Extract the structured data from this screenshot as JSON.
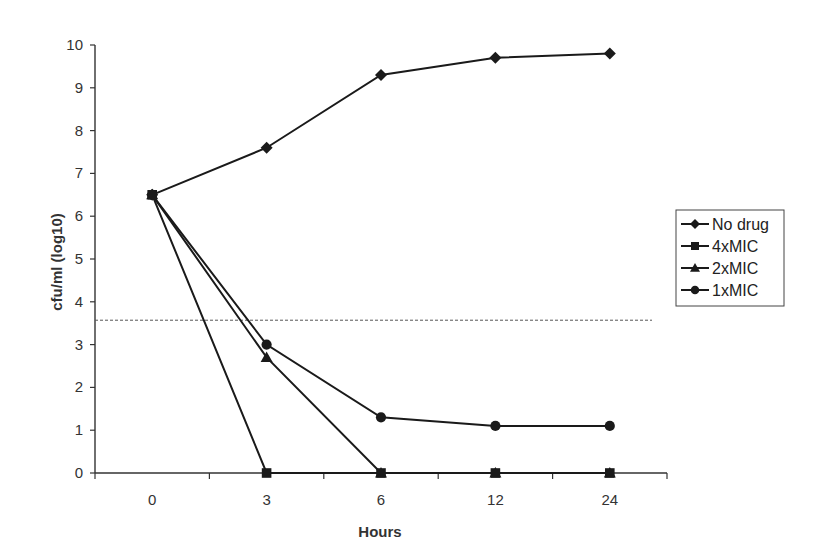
{
  "chart_data": {
    "type": "line",
    "title": "",
    "xlabel": "Hours",
    "ylabel": "cfu/ml (log10)",
    "categories": [
      "0",
      "3",
      "6",
      "12",
      "24"
    ],
    "ylim": [
      0,
      10
    ],
    "yticks": [
      "0",
      "1",
      "2",
      "3",
      "4",
      "5",
      "6",
      "7",
      "8",
      "9",
      "10"
    ],
    "grid": false,
    "legend_position": "right",
    "reference_line": {
      "style": "dashed",
      "y": 3.57
    },
    "series": [
      {
        "name": "No drug",
        "marker": "diamond",
        "values": [
          6.5,
          7.6,
          9.3,
          9.7,
          9.8
        ]
      },
      {
        "name": "4xMIC",
        "marker": "square",
        "values": [
          6.5,
          0,
          0,
          0,
          0
        ]
      },
      {
        "name": "2xMIC",
        "marker": "triangle",
        "values": [
          6.5,
          2.7,
          0,
          0,
          0
        ]
      },
      {
        "name": "1xMIC",
        "marker": "circle",
        "values": [
          6.5,
          3.0,
          1.3,
          1.1,
          1.1
        ]
      }
    ]
  },
  "colors": {
    "line": "#1a1a1a",
    "axis": "#333333",
    "text": "#333333"
  }
}
